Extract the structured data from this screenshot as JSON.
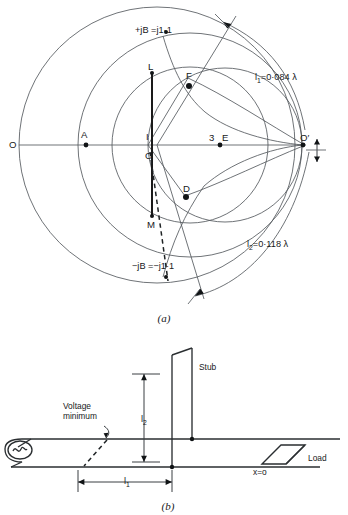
{
  "figure": {
    "caption_a": "(a)",
    "caption_b": "(b)",
    "smith_chart": {
      "points": [
        {
          "id": "O",
          "label": "O",
          "x": 12,
          "y": 144
        },
        {
          "id": "A",
          "label": "A",
          "x": 78,
          "y": 140
        },
        {
          "id": "I",
          "label": "I",
          "x": 148,
          "y": 140
        },
        {
          "id": "C",
          "label": "C",
          "x": 148,
          "y": 156
        },
        {
          "id": "L",
          "label": "L",
          "x": 155,
          "y": 72
        },
        {
          "id": "F",
          "label": "F",
          "x": 188,
          "y": 78
        },
        {
          "id": "D",
          "label": "D",
          "x": 185,
          "y": 196
        },
        {
          "id": "M",
          "label": "M",
          "x": 152,
          "y": 218
        },
        {
          "id": "3",
          "label": "3",
          "x": 212,
          "y": 140
        },
        {
          "id": "E",
          "label": "E",
          "x": 224,
          "y": 140
        },
        {
          "id": "Oprime",
          "label": "O′",
          "x": 302,
          "y": 142
        }
      ],
      "annotations": [
        {
          "id": "susceptance-positive",
          "label": "+jB =j1·1",
          "x": 140,
          "y": 31
        },
        {
          "id": "susceptance-negative",
          "label": "−jB =−j1·1",
          "x": 138,
          "y": 267
        },
        {
          "id": "length-l1",
          "label_main": "l",
          "label_sub": "1",
          "label_value": "=0·084 λ",
          "x": 256,
          "y": 79
        },
        {
          "id": "length-l2",
          "label_main": "l",
          "label_sub": "2",
          "label_value": "=0·118 λ",
          "x": 248,
          "y": 246
        }
      ]
    },
    "line_diagram": {
      "labels": [
        {
          "id": "voltage-minimum",
          "line1": "Voltage",
          "line2": "minimum",
          "x": 58,
          "y": 410
        },
        {
          "id": "stub",
          "label": "Stub",
          "x": 200,
          "y": 368
        },
        {
          "id": "load",
          "label": "Load",
          "x": 311,
          "y": 458
        },
        {
          "id": "x-equals-zero",
          "label": "x=o",
          "x": 258,
          "y": 474
        },
        {
          "id": "dim-l1",
          "label_main": "l",
          "label_sub": "1",
          "x": 131,
          "y": 483
        },
        {
          "id": "dim-l2",
          "label_main": "l",
          "label_sub": "2",
          "x": 147,
          "y": 419
        }
      ]
    }
  },
  "colors": {
    "ink": "#1a1a1a",
    "thin_line": "#555a5e",
    "background": "#ffffff"
  }
}
